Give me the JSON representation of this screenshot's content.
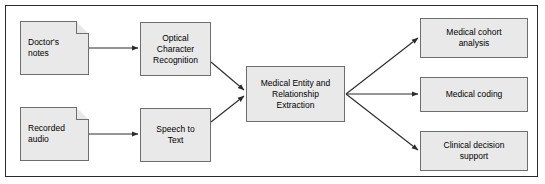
{
  "diagram": {
    "background_color": "#ffffff",
    "frame_color": "#2b2b2b",
    "node_fill_color": "#e9e9e9",
    "node_border_color": "#6e6e6e",
    "arrow_color": "#2b2b2b",
    "inputs": [
      {
        "id": "doctors-notes",
        "label": "Doctor's\nnotes",
        "shape": "document"
      },
      {
        "id": "recorded-audio",
        "label": "Recorded\naudio",
        "shape": "document"
      }
    ],
    "processors": [
      {
        "id": "ocr",
        "label": "Optical\nCharacter\nRecognition",
        "shape": "rectangle"
      },
      {
        "id": "speech-to-text",
        "label": "Speech to\nText",
        "shape": "rectangle"
      }
    ],
    "core": {
      "id": "medical-entity-relationship-extraction",
      "label": "Medical Entity and\nRelationship\nExtraction",
      "shape": "rectangle"
    },
    "outputs": [
      {
        "id": "medical-cohort-analysis",
        "label": "Medical cohort\nanalysis",
        "shape": "rectangle"
      },
      {
        "id": "medical-coding",
        "label": "Medical coding",
        "shape": "rectangle"
      },
      {
        "id": "clinical-decision-support",
        "label": "Clinical decision\nsupport",
        "shape": "rectangle"
      }
    ],
    "edges": [
      {
        "from": "doctors-notes",
        "to": "ocr"
      },
      {
        "from": "recorded-audio",
        "to": "speech-to-text"
      },
      {
        "from": "ocr",
        "to": "medical-entity-relationship-extraction"
      },
      {
        "from": "speech-to-text",
        "to": "medical-entity-relationship-extraction"
      },
      {
        "from": "medical-entity-relationship-extraction",
        "to": "medical-cohort-analysis"
      },
      {
        "from": "medical-entity-relationship-extraction",
        "to": "medical-coding"
      },
      {
        "from": "medical-entity-relationship-extraction",
        "to": "clinical-decision-support"
      }
    ]
  }
}
